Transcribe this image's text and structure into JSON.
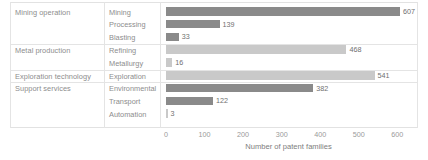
{
  "chart_data": {
    "type": "bar",
    "orientation": "horizontal",
    "title": "",
    "xlabel": "Number of patent families",
    "ylabel": "",
    "xlim": [
      0,
      650
    ],
    "ticks": [
      0,
      100,
      200,
      300,
      400,
      500,
      600
    ],
    "grid": false,
    "legend": "none",
    "groups": [
      {
        "label": "Mining operation",
        "rows": [
          {
            "category": "Mining",
            "value": 607,
            "color": "#8a8a8a"
          },
          {
            "category": "Processing",
            "value": 139,
            "color": "#8a8a8a"
          },
          {
            "category": "Blasting",
            "value": 33,
            "color": "#8a8a8a"
          }
        ]
      },
      {
        "label": "Metal production",
        "rows": [
          {
            "category": "Refining",
            "value": 468,
            "color": "#c9c9c9"
          },
          {
            "category": "Metallurgy",
            "value": 16,
            "color": "#c9c9c9"
          }
        ]
      },
      {
        "label": "Exploration technology",
        "rows": [
          {
            "category": "Exploration",
            "value": 541,
            "color": "#c9c9c9"
          }
        ]
      },
      {
        "label": "Support services",
        "rows": [
          {
            "category": "Environmental",
            "value": 382,
            "color": "#8a8a8a"
          },
          {
            "category": "Transport",
            "value": 122,
            "color": "#8a8a8a"
          },
          {
            "category": "Automation",
            "value": 3,
            "color": "#c9c9c9"
          }
        ]
      }
    ],
    "categories": [
      "Mining",
      "Processing",
      "Blasting",
      "Refining",
      "Metallurgy",
      "Exploration",
      "Environmental",
      "Transport",
      "Automation"
    ],
    "values": [
      607,
      139,
      33,
      468,
      16,
      541,
      382,
      122,
      3
    ],
    "colors": {
      "dark_bar": "#8a8a8a",
      "light_bar": "#c9c9c9",
      "text": "#8d8d8d",
      "gridline": "#e4e4e4",
      "background": "#ffffff"
    }
  }
}
